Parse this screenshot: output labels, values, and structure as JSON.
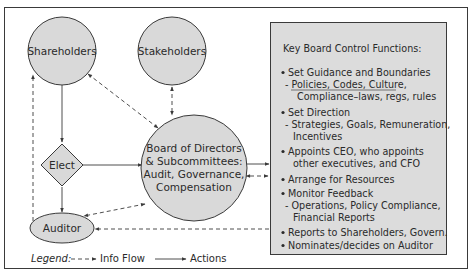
{
  "colors": {
    "node_fill": "#d9d9d9",
    "stroke": "#3a3a3a",
    "box_fill": "#dcdcdc",
    "background": "#ffffff"
  },
  "nodes": {
    "shareholders": {
      "label": "Shareholders"
    },
    "stakeholders": {
      "label": "Stakeholders"
    },
    "board": {
      "lines": [
        "Board of Directors",
        "& Subcommittees:",
        "Audit, Governance,",
        "Compensation"
      ]
    },
    "elect": {
      "label": "Elect"
    },
    "auditor": {
      "label": "Auditor"
    }
  },
  "functions_box": {
    "title": "Key Board Control Functions:",
    "items": [
      {
        "bullet": true,
        "text": "Set Guidance and Boundaries"
      },
      {
        "bullet": false,
        "text": "- Policies, Codes, Culture,"
      },
      {
        "bullet": false,
        "text": "Compliance–laws, regs, rules"
      },
      {
        "bullet": true,
        "text": "Set Direction"
      },
      {
        "bullet": false,
        "text": "- Strategies, Goals, Remuneration,"
      },
      {
        "bullet": false,
        "text": "Incentives"
      },
      {
        "bullet": true,
        "text": "Appoints CEO, who appoints"
      },
      {
        "bullet": false,
        "text": "other executives, and CFO"
      },
      {
        "bullet": true,
        "text": "Arrange for Resources"
      },
      {
        "bullet": true,
        "text": "Monitor Feedback"
      },
      {
        "bullet": false,
        "text": "- Operations, Policy Compliance,"
      },
      {
        "bullet": false,
        "text": "Financial Reports"
      },
      {
        "bullet": true,
        "text": "Reports to Shareholders, Govern."
      },
      {
        "bullet": true,
        "text": "Nominates/decides on Auditor"
      }
    ]
  },
  "legend": {
    "label": "Legend:",
    "info_flow": "Info Flow",
    "actions": "Actions"
  },
  "edges": [
    {
      "from": "Shareholders",
      "to": "Elect",
      "type": "action"
    },
    {
      "from": "Elect",
      "to": "Board",
      "type": "action"
    },
    {
      "from": "Elect",
      "to": "Auditor",
      "type": "action"
    },
    {
      "from": "Board",
      "to": "Functions",
      "type": "action"
    },
    {
      "from": "Shareholders",
      "to": "Board",
      "type": "info",
      "bidirectional": true
    },
    {
      "from": "Stakeholders",
      "to": "Board",
      "type": "info",
      "bidirectional": true
    },
    {
      "from": "Board",
      "to": "Auditor",
      "type": "info",
      "bidirectional": true
    },
    {
      "from": "Functions",
      "to": "Board",
      "type": "info",
      "bidirectional": true
    },
    {
      "from": "Functions",
      "to": "Auditor",
      "type": "info"
    },
    {
      "from": "Auditor",
      "to": "Shareholders",
      "type": "info"
    }
  ]
}
